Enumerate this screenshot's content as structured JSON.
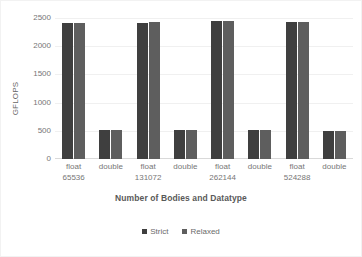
{
  "chart_data": {
    "type": "bar",
    "title": "",
    "xlabel": "Number of Bodies and Datatype",
    "ylabel": "GFLOPS",
    "ylim": [
      0,
      2500
    ],
    "yticks": [
      0,
      500,
      1000,
      1500,
      2000,
      2500
    ],
    "ytick_labels": [
      "0",
      "500",
      "1000",
      "1500",
      "2000",
      "2500"
    ],
    "grid": true,
    "legend_position": "bottom",
    "categories": [
      "float 65536",
      "double 65536",
      "float 131072",
      "double 131072",
      "float 262144",
      "double 262144",
      "float 524288",
      "double 524288"
    ],
    "category_labels": [
      {
        "datatype": "float",
        "bodies": "65536"
      },
      {
        "datatype": "double",
        "bodies": ""
      },
      {
        "datatype": "float",
        "bodies": "131072"
      },
      {
        "datatype": "double",
        "bodies": ""
      },
      {
        "datatype": "float",
        "bodies": "262144"
      },
      {
        "datatype": "double",
        "bodies": ""
      },
      {
        "datatype": "float",
        "bodies": "524288"
      },
      {
        "datatype": "double",
        "bodies": ""
      }
    ],
    "series": [
      {
        "name": "Strict",
        "color": "#3f3f3f",
        "values": [
          2415,
          520,
          2410,
          520,
          2440,
          520,
          2435,
          490
        ]
      },
      {
        "name": "Relaxed",
        "color": "#5e5e5e",
        "values": [
          2415,
          520,
          2425,
          520,
          2445,
          520,
          2435,
          490
        ]
      }
    ]
  },
  "legend": {
    "items": [
      {
        "label": "Strict",
        "color": "#3f3f3f"
      },
      {
        "label": "Relaxed",
        "color": "#5e5e5e"
      }
    ]
  }
}
